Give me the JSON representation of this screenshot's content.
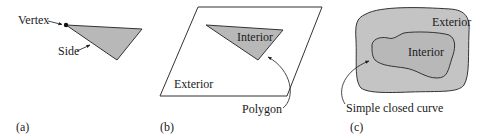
{
  "figure": {
    "panels": [
      {
        "id": "a",
        "caption": "(a)",
        "labels": {
          "vertex": "Vertex",
          "side": "Side"
        }
      },
      {
        "id": "b",
        "caption": "(b)",
        "labels": {
          "interior": "Interior",
          "exterior": "Exterior",
          "polygon": "Polygon"
        }
      },
      {
        "id": "c",
        "caption": "(c)",
        "labels": {
          "interior": "Interior",
          "exterior": "Exterior",
          "curve": "Simple closed curve"
        }
      }
    ],
    "colors": {
      "fill_gray": "#b8b8b8",
      "outer_gray": "#c4c4c4",
      "stroke": "#333333",
      "text": "#1a1a1a",
      "background": "#ffffff"
    }
  }
}
